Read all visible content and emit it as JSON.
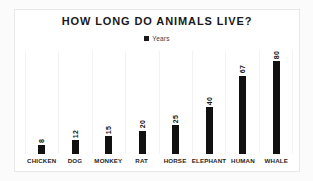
{
  "chart_data": {
    "type": "bar",
    "title": "HOW LONG DO ANIMALS LIVE?",
    "xlabel": "",
    "ylabel": "",
    "ylim": [
      0,
      88
    ],
    "grid": "vertical-category-separators",
    "legend_position": "top-center",
    "legend": [
      "Years"
    ],
    "bar_color": "#111111",
    "categories": [
      "CHICKEN",
      "DOG",
      "MONKEY",
      "RAT",
      "HORSE",
      "ELEPHANT",
      "HUMAN",
      "WHALE"
    ],
    "series": [
      {
        "name": "Years",
        "values": [
          8,
          12,
          15,
          20,
          25,
          40,
          67,
          80
        ]
      }
    ],
    "value_labels": [
      "8",
      "12",
      "15",
      "20",
      "25",
      "40",
      "67",
      "80"
    ]
  },
  "colors": {
    "background": "#fbfbfb",
    "card": "#ffffff",
    "card_border": "#e8e8e8",
    "bar": "#111111",
    "gridline": "#f2f2f2",
    "text": "#1a1a1a"
  }
}
